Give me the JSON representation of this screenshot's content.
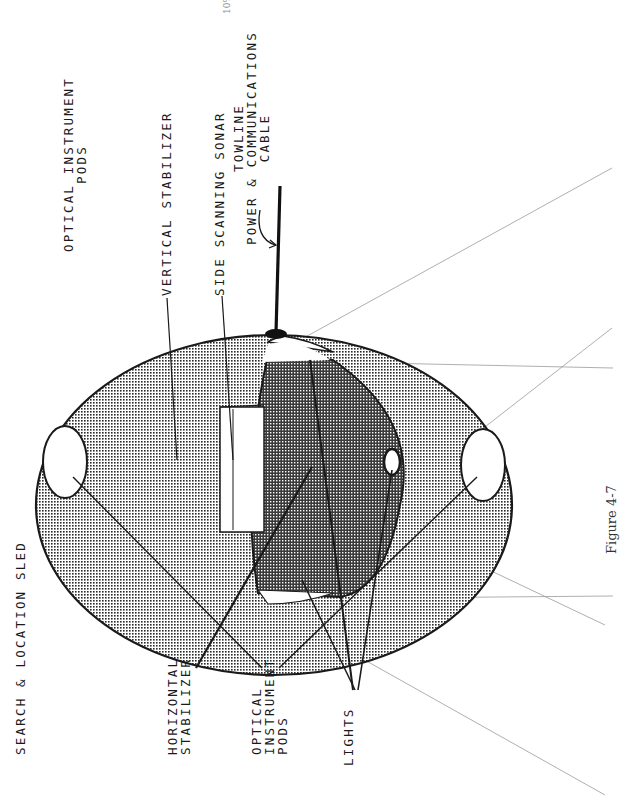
{
  "page_number": "10%",
  "title": "SEARCH & LOCATION SLED",
  "figure_caption": "Figure 4-7",
  "labels": {
    "optical_pods_top_line1": "OPTICAL INSTRUMENT",
    "optical_pods_top_line2": "PODS",
    "vertical_stabilizer": "VERTICAL STABILIZER",
    "side_scanning_sonar": "SIDE SCANNING SONAR",
    "towline_line1": "TOWLINE",
    "towline_line2": "POWER & COMMUNICATIONS",
    "towline_line3": "CABLE",
    "horizontal_stabilizer_line1": "HORIZONTAL",
    "horizontal_stabilizer_line2": "STABILIZER",
    "optical_pods_bottom_line1": "OPTICAL",
    "optical_pods_bottom_line2": "INSTRUMENT",
    "optical_pods_bottom_line3": "PODS",
    "lights": "LIGHTS"
  },
  "colors": {
    "ink": "#1a1a1a",
    "light_halftone": "#b8b8b8",
    "dark_halftone": "#7a7a7a",
    "construction_line": "#9a9a9a",
    "paper": "#ffffff"
  }
}
